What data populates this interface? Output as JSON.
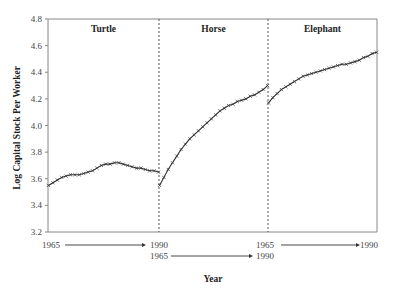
{
  "chart_data": {
    "type": "line",
    "title": "",
    "xlabel": "Year",
    "ylabel": "Log Capital Stock Per Worker",
    "ylim": [
      3.2,
      4.8
    ],
    "yticks": [
      3.2,
      3.4,
      3.6,
      3.8,
      4.0,
      4.2,
      4.4,
      4.6,
      4.8
    ],
    "ytick_labels": [
      "3.2",
      "3.4",
      "3.6",
      "3.8",
      "4.0",
      "4.2",
      "4.4",
      "4.6",
      "4.8"
    ],
    "grid": false,
    "legend": null,
    "marker": "x",
    "panels": [
      {
        "name": "Turtle",
        "x_start_label": "1965",
        "x_end_label": "1990",
        "years": [
          1965,
          1966,
          1967,
          1968,
          1969,
          1970,
          1971,
          1972,
          1973,
          1974,
          1975,
          1976,
          1977,
          1978,
          1979,
          1980,
          1981,
          1982,
          1983,
          1984,
          1985,
          1986,
          1987,
          1988,
          1989,
          1990
        ],
        "values": [
          3.55,
          3.57,
          3.59,
          3.61,
          3.62,
          3.63,
          3.63,
          3.63,
          3.64,
          3.65,
          3.66,
          3.68,
          3.7,
          3.71,
          3.71,
          3.72,
          3.72,
          3.71,
          3.7,
          3.69,
          3.68,
          3.68,
          3.67,
          3.66,
          3.66,
          3.65
        ]
      },
      {
        "name": "Horse",
        "x_start_label": "1965",
        "x_end_label": "1990",
        "years": [
          1965,
          1966,
          1967,
          1968,
          1969,
          1970,
          1971,
          1972,
          1973,
          1974,
          1975,
          1976,
          1977,
          1978,
          1979,
          1980,
          1981,
          1982,
          1983,
          1984,
          1985,
          1986,
          1987,
          1988,
          1989,
          1990
        ],
        "values": [
          3.55,
          3.61,
          3.67,
          3.72,
          3.77,
          3.82,
          3.86,
          3.9,
          3.93,
          3.96,
          3.99,
          4.02,
          4.05,
          4.08,
          4.11,
          4.13,
          4.15,
          4.16,
          4.18,
          4.19,
          4.2,
          4.22,
          4.23,
          4.25,
          4.27,
          4.3
        ]
      },
      {
        "name": "Elephant",
        "x_start_label": "1965",
        "x_end_label": "1990",
        "years": [
          1965,
          1966,
          1967,
          1968,
          1969,
          1970,
          1971,
          1972,
          1973,
          1974,
          1975,
          1976,
          1977,
          1978,
          1979,
          1980,
          1981,
          1982,
          1983,
          1984,
          1985,
          1986,
          1987,
          1988,
          1989,
          1990
        ],
        "values": [
          4.17,
          4.21,
          4.24,
          4.27,
          4.29,
          4.31,
          4.33,
          4.35,
          4.37,
          4.38,
          4.39,
          4.4,
          4.41,
          4.42,
          4.43,
          4.44,
          4.45,
          4.46,
          4.46,
          4.47,
          4.48,
          4.49,
          4.51,
          4.52,
          4.54,
          4.55
        ]
      }
    ]
  },
  "labels": {
    "ylabel": "Log Capital Stock Per Worker",
    "xlabel": "Year",
    "panel_titles": [
      "Turtle",
      "Horse",
      "Elephant"
    ],
    "x_ranges": [
      {
        "start": "1965",
        "end": "1990"
      },
      {
        "start": "1965",
        "end": "1990"
      },
      {
        "start": "1965",
        "end": "1990"
      }
    ]
  },
  "colors": {
    "line": "#333333",
    "axis": "#888888",
    "divider": "#555555",
    "text": "#222222"
  }
}
